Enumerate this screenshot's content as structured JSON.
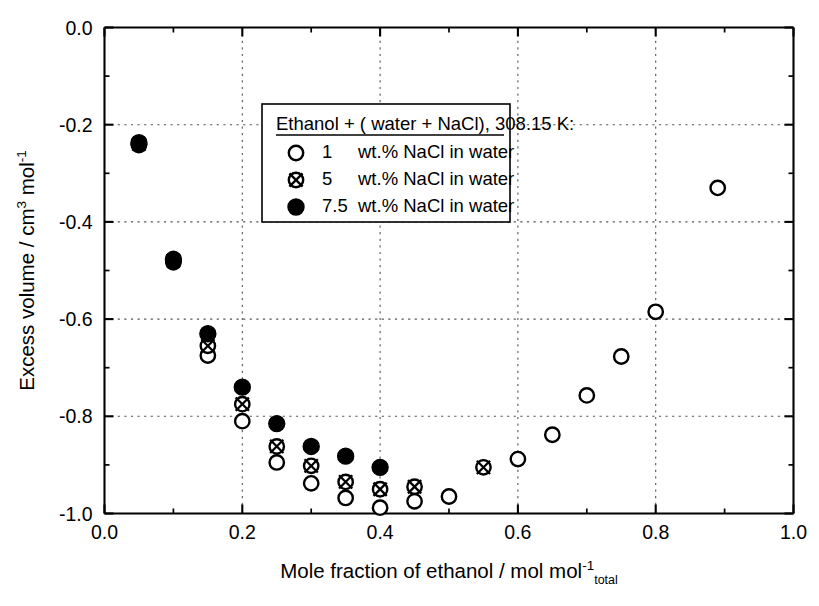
{
  "chart_data": {
    "type": "scatter",
    "title": "",
    "xlabel": "Mole fraction of ethanol / mol mol-1 total",
    "ylabel": "Excess volume / cm3 mol-1",
    "xlim": [
      0.0,
      1.0
    ],
    "ylim": [
      -1.0,
      0.0
    ],
    "grid": true,
    "legend_position": "upper-center",
    "legend_title": "Ethanol + ( water + NaCl), 308.15 K:",
    "xticks": [
      "0.0",
      "0.2",
      "0.4",
      "0.6",
      "0.8",
      "1.0"
    ],
    "xtick_values": [
      0.0,
      0.2,
      0.4,
      0.6,
      0.8,
      1.0
    ],
    "yticks": [
      "0.0",
      "-0.2",
      "-0.4",
      "-0.6",
      "-0.8",
      "-1.0"
    ],
    "ytick_values": [
      0.0,
      -0.2,
      -0.4,
      -0.6,
      -0.8,
      -1.0
    ],
    "xminor_step": 0.05,
    "yminor_step": 0.05,
    "series": [
      {
        "name": "1 wt.% NaCl in water",
        "marker": "open-circle",
        "concentration": "1",
        "unit_label": "wt.% NaCl in water",
        "points": [
          [
            0.05,
            -0.242
          ],
          [
            0.1,
            -0.483
          ],
          [
            0.15,
            -0.675
          ],
          [
            0.2,
            -0.81
          ],
          [
            0.25,
            -0.895
          ],
          [
            0.3,
            -0.938
          ],
          [
            0.35,
            -0.968
          ],
          [
            0.4,
            -0.988
          ],
          [
            0.45,
            -0.975
          ],
          [
            0.5,
            -0.965
          ],
          [
            0.6,
            -0.888
          ],
          [
            0.65,
            -0.838
          ],
          [
            0.7,
            -0.757
          ],
          [
            0.75,
            -0.677
          ],
          [
            0.8,
            -0.585
          ],
          [
            0.89,
            -0.33
          ]
        ]
      },
      {
        "name": "5 wt.% NaCl in water",
        "marker": "crossed-circle",
        "concentration": "5",
        "unit_label": "wt.% NaCl in water",
        "points": [
          [
            0.05,
            -0.24
          ],
          [
            0.1,
            -0.48
          ],
          [
            0.15,
            -0.655
          ],
          [
            0.2,
            -0.775
          ],
          [
            0.25,
            -0.862
          ],
          [
            0.3,
            -0.902
          ],
          [
            0.35,
            -0.935
          ],
          [
            0.4,
            -0.95
          ],
          [
            0.45,
            -0.945
          ],
          [
            0.55,
            -0.905
          ]
        ]
      },
      {
        "name": "7.5 wt.% NaCl in water",
        "marker": "filled-circle",
        "concentration": "7.5",
        "unit_label": "wt.% NaCl in water",
        "points": [
          [
            0.05,
            -0.237
          ],
          [
            0.1,
            -0.477
          ],
          [
            0.15,
            -0.63
          ],
          [
            0.2,
            -0.74
          ],
          [
            0.25,
            -0.815
          ],
          [
            0.3,
            -0.862
          ],
          [
            0.35,
            -0.882
          ],
          [
            0.4,
            -0.905
          ]
        ]
      }
    ]
  },
  "axes": {
    "x_title_main": "Mole fraction of ethanol / mol mol",
    "x_title_sup": "-1",
    "x_title_sub": "total",
    "y_title_part1": "Excess volume / cm",
    "y_title_sup1": "3",
    "y_title_part2": " mol",
    "y_title_sup2": "-1"
  },
  "legend": {
    "title": "Ethanol + ( water + NaCl), 308.15 K:",
    "entries": [
      {
        "concentration": "1",
        "text": "wt.% NaCl in water",
        "marker": "open-circle"
      },
      {
        "concentration": "5",
        "text": "wt.% NaCl in water",
        "marker": "crossed-circle"
      },
      {
        "concentration": "7.5",
        "text": "wt.% NaCl in water",
        "marker": "filled-circle"
      }
    ]
  },
  "colors": {
    "foreground": "#000000",
    "background": "#ffffff",
    "grid": "#555555"
  }
}
